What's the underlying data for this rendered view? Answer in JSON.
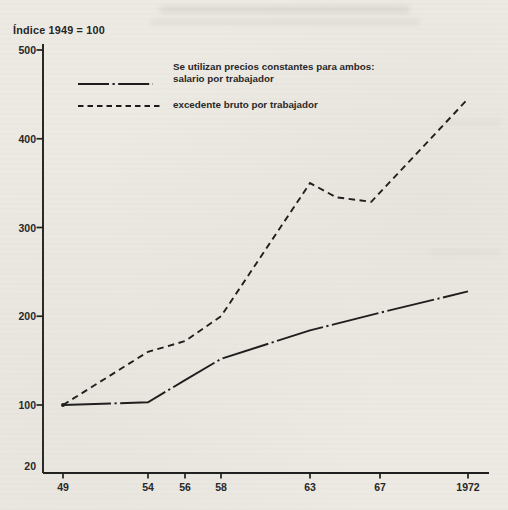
{
  "page": {
    "title": "Índice 1949 = 100"
  },
  "legend": {
    "note": "Se utilizan precios constantes para ambos:",
    "series1_label": "salario por trabajador",
    "series2_label": "excedente bruto por trabajador"
  },
  "colors": {
    "ink": "#1e1e1e",
    "paper": "#edeae4"
  },
  "chart_data": {
    "type": "line",
    "title": "Índice 1949 = 100",
    "subtitle": "",
    "legend_position": "top-left-inside",
    "grid": false,
    "x_axis": {
      "ticks": [
        {
          "label": "49",
          "year": 1949
        },
        {
          "label": "54",
          "year": 1954
        },
        {
          "label": "56",
          "year": 1956
        },
        {
          "label": "58",
          "year": 1958
        },
        {
          "label": "63",
          "year": 1963
        },
        {
          "label": "67",
          "year": 1967
        },
        {
          "label": "1972",
          "year": 1972
        }
      ],
      "range": [
        1949,
        1972
      ]
    },
    "y_axis": {
      "ticks": [
        {
          "label": "500",
          "value": 500
        },
        {
          "label": "400",
          "value": 400
        },
        {
          "label": "300",
          "value": 300
        },
        {
          "label": "200",
          "value": 200
        },
        {
          "label": "100",
          "value": 100
        },
        {
          "label": "20",
          "value": 20
        }
      ],
      "range": [
        20,
        500
      ]
    },
    "series": [
      {
        "name": "salario por trabajador",
        "style": "dash-dot",
        "values_at_ticks": [
          100,
          103,
          128,
          152,
          184,
          204,
          228
        ],
        "points": [
          [
            1949,
            100
          ],
          [
            1954,
            103
          ],
          [
            1956,
            128
          ],
          [
            1958,
            152
          ],
          [
            1963,
            184
          ],
          [
            1967,
            204
          ],
          [
            1972,
            228
          ]
        ]
      },
      {
        "name": "excedente bruto por trabajador",
        "style": "dashed",
        "values_at_ticks": [
          100,
          160,
          172,
          200,
          350,
          331,
          445
        ],
        "points": [
          [
            1949,
            100
          ],
          [
            1954,
            160
          ],
          [
            1956,
            172
          ],
          [
            1958,
            200
          ],
          [
            1963,
            350
          ],
          [
            1964.5,
            334
          ],
          [
            1966.5,
            329
          ],
          [
            1972,
            445
          ]
        ]
      }
    ]
  }
}
